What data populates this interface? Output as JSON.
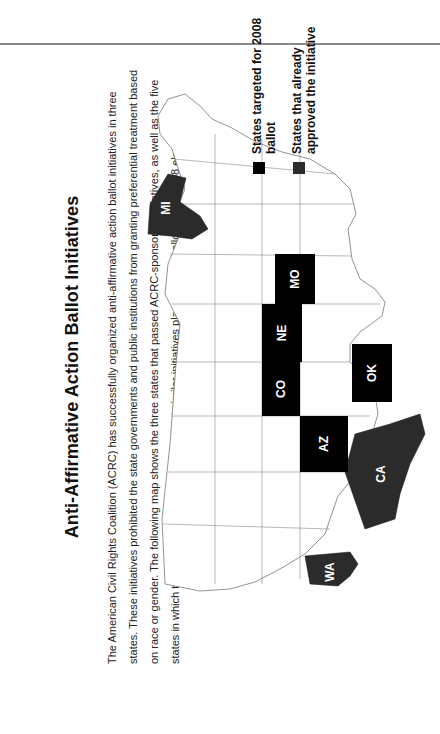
{
  "title": "Anti-Affirmative Action Ballot Initiatives",
  "description": "The American Civil Rights Coalition (ACRC) has successfully organized anti-affirmative action ballot initiatives in three states. These initiatives prohibited the state governments and public institutions from granting preferential treatment based on race or gender. The following map shows the three states that passed ACRC-sponsored initiatives, as well as the five states in which the ACRC is currently working to get similar initiatives placed on the ballot for the 2008 elections.",
  "legend": {
    "targeted": {
      "label": "States targeted for 2008 ballot",
      "color": "#000000"
    },
    "approved": {
      "label": "States that already approved the initiative",
      "color": "#2b2b2b"
    }
  },
  "map": {
    "orientation": "rotated 90° counter-clockwise",
    "states_targeted_2008": [
      "AZ",
      "CO",
      "MO",
      "NE",
      "OK"
    ],
    "states_approved": [
      "CA",
      "MI",
      "WA"
    ],
    "labels": {
      "WA": "WA",
      "CA": "CA",
      "AZ": "AZ",
      "CO": "CO",
      "NE": "NE",
      "OK": "OK",
      "MO": "MO",
      "MI": "MI"
    }
  }
}
